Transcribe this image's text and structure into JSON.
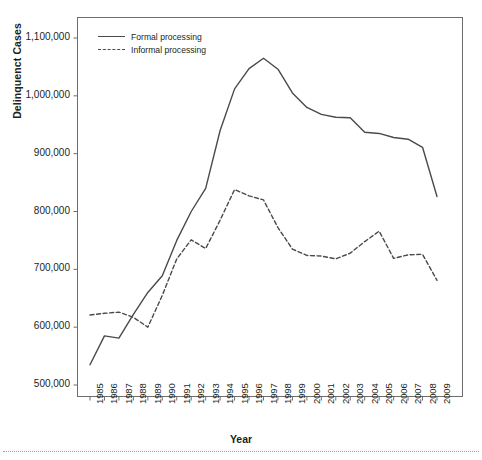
{
  "chart_data": {
    "type": "line",
    "title": "",
    "subtitle": "",
    "xlabel": "Year",
    "ylabel": "Delinquenct Cases",
    "x": [
      1985,
      1986,
      1987,
      1988,
      1989,
      1990,
      1991,
      1992,
      1993,
      1994,
      1995,
      1996,
      1997,
      1998,
      1999,
      2000,
      2001,
      2002,
      2003,
      2004,
      2005,
      2006,
      2007,
      2008,
      2009
    ],
    "categories": [
      "1985",
      "1986",
      "1987",
      "1988",
      "1989",
      "1990",
      "1991",
      "1992",
      "1993",
      "1994",
      "1995",
      "1996",
      "1997",
      "1998",
      "1999",
      "2000",
      "2001",
      "2002",
      "2003",
      "2004",
      "2005",
      "2006",
      "2007",
      "2008",
      "2009"
    ],
    "series": [
      {
        "name": "Formal processing",
        "style": "solid",
        "color": "#4a4a4a",
        "values": [
          535000,
          585000,
          581000,
          622000,
          660000,
          689000,
          750000,
          800000,
          840000,
          940000,
          1012000,
          1047000,
          1065000,
          1046000,
          1005000,
          980000,
          968000,
          963000,
          962000,
          937000,
          935000,
          928000,
          925000,
          911000,
          826000
        ]
      },
      {
        "name": "Informal processing",
        "style": "dashed",
        "color": "#4a4a4a",
        "values": [
          621000,
          624000,
          626000,
          617000,
          600000,
          655000,
          718000,
          751000,
          736000,
          785000,
          838000,
          827000,
          820000,
          772000,
          735000,
          724000,
          723000,
          718000,
          728000,
          748000,
          766000,
          719000,
          725000,
          726000,
          681000
        ]
      }
    ],
    "ylim": [
      470000,
      1130000
    ],
    "yticks": [
      500000,
      600000,
      700000,
      800000,
      900000,
      1000000,
      1100000
    ],
    "ytick_labels": [
      "500,000",
      "600,000",
      "700,000",
      "800,000",
      "900,000",
      "1,000,000",
      "1,100,000"
    ],
    "grid": false,
    "legend_position": "top-left",
    "legend_entries": [
      "Formal processing",
      "Informal processing"
    ]
  },
  "axes": {
    "y_title": "Delinquenct Cases",
    "x_title": "Year"
  },
  "legend": {
    "items": [
      {
        "label": "Formal processing",
        "style": "solid"
      },
      {
        "label": "Informal processing",
        "style": "dashed"
      }
    ]
  }
}
